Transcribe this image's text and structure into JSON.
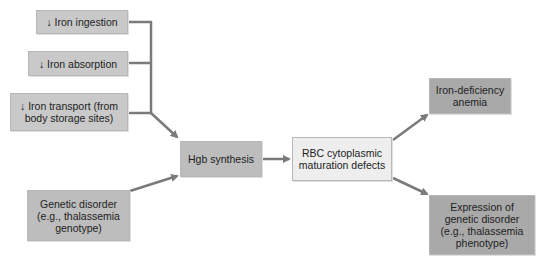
{
  "nodes": {
    "iron_ingestion": "↓ Iron ingestion",
    "iron_absorption": "↓ Iron absorption",
    "iron_transport_l1": "↓ Iron transport (from",
    "iron_transport_l2": "body storage sites)",
    "genetic_l1": "Genetic disorder",
    "genetic_l2": "(e.g., thalassemia",
    "genetic_l3": "genotype)",
    "hgb": "Hgb synthesis",
    "rbc_l1": "RBC cytoplasmic",
    "rbc_l2": "maturation defects",
    "ida_l1": "Iron-deficiency",
    "ida_l2": "anemia",
    "expr_l1": "Expression of",
    "expr_l2": "genetic disorder",
    "expr_l3": "(e.g., thalassemia",
    "expr_l4": "phenotype)"
  },
  "colors": {
    "arrow": "#7a7a7a"
  }
}
